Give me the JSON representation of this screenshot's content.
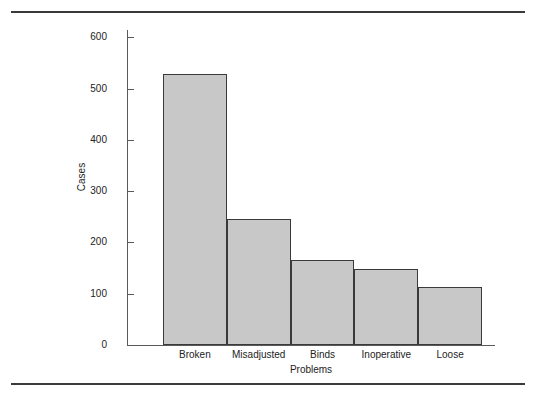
{
  "page": {
    "rules": [
      {
        "name": "top-rule"
      },
      {
        "name": "bottom-rule"
      }
    ]
  },
  "chart_data": {
    "type": "bar",
    "title": "",
    "subtitle": "",
    "xlabel": "Problems",
    "ylabel": "Cases",
    "categories": [
      "Broken",
      "Misadjusted",
      "Binds",
      "Inoperative",
      "Loose"
    ],
    "values": [
      528,
      246,
      165,
      148,
      113
    ],
    "series": [
      {
        "name": "Cases",
        "values": [
          528,
          246,
          165,
          148,
          113
        ]
      }
    ],
    "ylim": [
      0,
      620
    ],
    "yticks": [
      0,
      100,
      200,
      300,
      400,
      500,
      600
    ],
    "ytick_labels": [
      "0",
      "100",
      "200",
      "300",
      "400",
      "500",
      "600"
    ],
    "grid": false,
    "legend": false,
    "legend_position": "none",
    "bar_fill_color": "#c8c8c8",
    "bar_edge_color": "#3a3a3a",
    "axis_color": "#5a5a5a",
    "text_color": "#232323",
    "background_color": "#ffffff",
    "bars_contiguous": true,
    "annotations": []
  }
}
